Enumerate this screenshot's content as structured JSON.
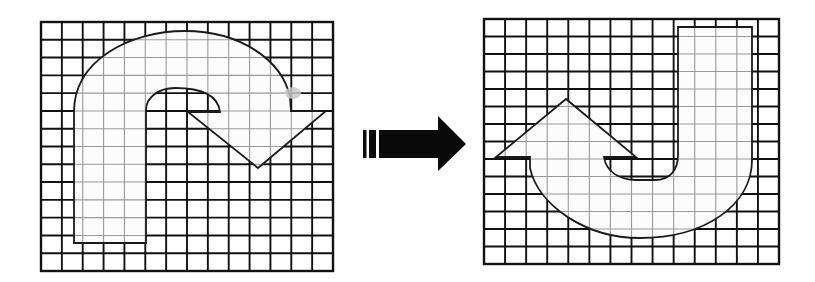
{
  "diagram": {
    "colors": {
      "background": "#ffffff",
      "grid_line": "#111111",
      "grid_line_inside": "#9a9a9a",
      "shape_fill": "#fcfcfc",
      "shape_outline": "#1a1a1a",
      "arrow": "#0a0a0a",
      "smudge": "#c8c8c8"
    },
    "left_grid": {
      "x": 41,
      "y": 22,
      "width": 292,
      "height": 249,
      "cols": 14,
      "rows": 14
    },
    "right_grid": {
      "x": 484,
      "y": 19,
      "width": 295,
      "height": 245,
      "cols": 14,
      "rows": 14
    },
    "transform_arrow": {
      "direction": "right",
      "label": ""
    },
    "left_shape_label": "original hooked arrow",
    "right_shape_label": "rotated hooked arrow"
  }
}
